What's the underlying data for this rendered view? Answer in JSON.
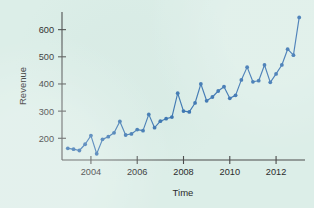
{
  "chart_data": {
    "type": "line",
    "title": "",
    "subtitle": "",
    "xlabel": "Time",
    "ylabel": "Revenue",
    "xlim": [
      2002.75,
      2013.25
    ],
    "ylim": [
      120,
      665
    ],
    "grid": false,
    "legend": null,
    "markers": "filled-circle",
    "series_color": "#2f6cad",
    "xticks": [
      2004,
      2006,
      2008,
      2010,
      2012
    ],
    "xticklabels": [
      "2004",
      "2006",
      "2008",
      "2010",
      "2012"
    ],
    "yticks": [
      200,
      300,
      400,
      500,
      600
    ],
    "yticklabels": [
      "200",
      "300",
      "400",
      "500",
      "600"
    ],
    "x": [
      2003.0,
      2003.25,
      2003.5,
      2003.75,
      2004.0,
      2004.25,
      2004.5,
      2004.75,
      2005.0,
      2005.25,
      2005.5,
      2005.75,
      2006.0,
      2006.25,
      2006.5,
      2006.75,
      2007.0,
      2007.25,
      2007.5,
      2007.75,
      2008.0,
      2008.25,
      2008.5,
      2008.75,
      2009.0,
      2009.25,
      2009.5,
      2009.75,
      2010.0,
      2010.25,
      2010.5,
      2010.75,
      2011.0,
      2011.25,
      2011.5,
      2011.75,
      2012.0,
      2012.25,
      2012.5,
      2012.75,
      2013.0
    ],
    "values": [
      163,
      160,
      155,
      178,
      210,
      143,
      196,
      206,
      220,
      262,
      212,
      216,
      232,
      228,
      288,
      239,
      263,
      272,
      278,
      366,
      300,
      297,
      330,
      400,
      338,
      352,
      374,
      390,
      347,
      358,
      415,
      462,
      408,
      412,
      470,
      406,
      437,
      470,
      528,
      506,
      645
    ],
    "series_name": "Revenue",
    "n_points": 41,
    "frequency": "quarterly",
    "trend": "increasing with seasonal peaks"
  },
  "figure": {
    "background_color": "#dceee8",
    "axis_color": "#4a4a4a"
  }
}
